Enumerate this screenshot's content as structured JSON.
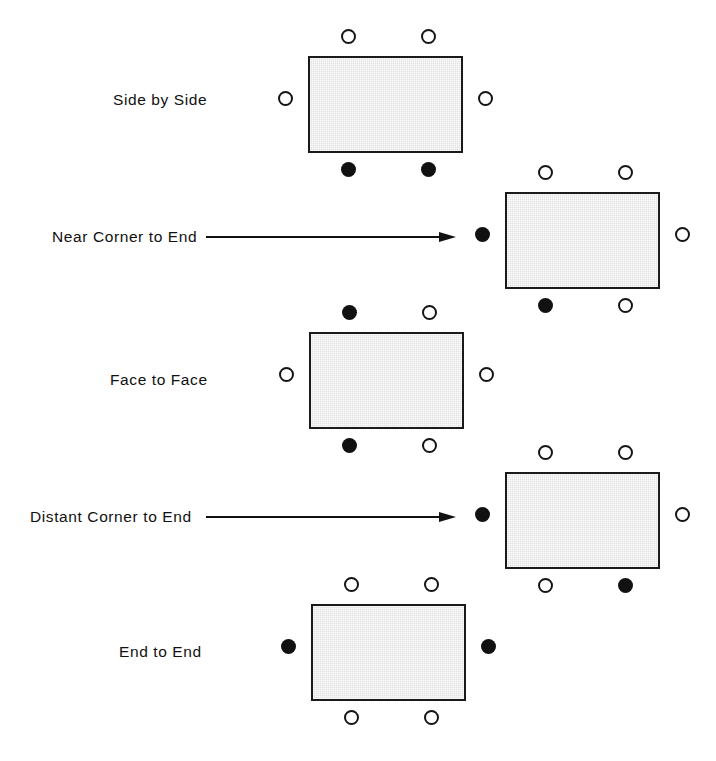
{
  "figure": {
    "background_color": "#ffffff",
    "table_fill_color": "#e2e2e2",
    "table_border_color": "#1a1a1a",
    "seat_open_color": "#ffffff",
    "seat_filled_color": "#111111",
    "width": 716,
    "height": 761
  },
  "legend_semantics": {
    "open_seat": "unoccupied seat position",
    "filled_seat": "occupied seat position"
  },
  "rows": [
    {
      "label": "Side by Side",
      "label_left": 113,
      "label_top": 92,
      "has_arrow": false,
      "table": {
        "left": 308,
        "top": 56,
        "width": 155,
        "height": 97
      },
      "seats": [
        {
          "name": "seat-top-left",
          "state": "open",
          "x": 341,
          "y": 29
        },
        {
          "name": "seat-top-right",
          "state": "open",
          "x": 421,
          "y": 29
        },
        {
          "name": "seat-left",
          "state": "open",
          "x": 278,
          "y": 91
        },
        {
          "name": "seat-right",
          "state": "open",
          "x": 478,
          "y": 91
        },
        {
          "name": "seat-bottom-left",
          "state": "filled",
          "x": 341,
          "y": 162
        },
        {
          "name": "seat-bottom-right",
          "state": "filled",
          "x": 421,
          "y": 162
        }
      ]
    },
    {
      "label": "Near Corner to End",
      "label_left": 52,
      "label_top": 229,
      "has_arrow": true,
      "arrow": {
        "left": 206,
        "top": 231,
        "length": 250
      },
      "table": {
        "left": 505,
        "top": 192,
        "width": 155,
        "height": 97
      },
      "seats": [
        {
          "name": "seat-top-left",
          "state": "open",
          "x": 538,
          "y": 165
        },
        {
          "name": "seat-top-right",
          "state": "open",
          "x": 618,
          "y": 165
        },
        {
          "name": "seat-left",
          "state": "filled",
          "x": 475,
          "y": 227
        },
        {
          "name": "seat-right",
          "state": "open",
          "x": 675,
          "y": 227
        },
        {
          "name": "seat-bottom-left",
          "state": "filled",
          "x": 538,
          "y": 298
        },
        {
          "name": "seat-bottom-right",
          "state": "open",
          "x": 618,
          "y": 298
        }
      ]
    },
    {
      "label": "Face to Face",
      "label_left": 110,
      "label_top": 372,
      "has_arrow": false,
      "table": {
        "left": 309,
        "top": 332,
        "width": 155,
        "height": 97
      },
      "seats": [
        {
          "name": "seat-top-left",
          "state": "filled",
          "x": 342,
          "y": 305
        },
        {
          "name": "seat-top-right",
          "state": "open",
          "x": 422,
          "y": 305
        },
        {
          "name": "seat-left",
          "state": "open",
          "x": 279,
          "y": 367
        },
        {
          "name": "seat-right",
          "state": "open",
          "x": 479,
          "y": 367
        },
        {
          "name": "seat-bottom-left",
          "state": "filled",
          "x": 342,
          "y": 438
        },
        {
          "name": "seat-bottom-right",
          "state": "open",
          "x": 422,
          "y": 438
        }
      ]
    },
    {
      "label": "Distant Corner to End",
      "label_left": 30,
      "label_top": 509,
      "has_arrow": true,
      "arrow": {
        "left": 206,
        "top": 511,
        "length": 250
      },
      "table": {
        "left": 505,
        "top": 472,
        "width": 155,
        "height": 97
      },
      "seats": [
        {
          "name": "seat-top-left",
          "state": "open",
          "x": 538,
          "y": 445
        },
        {
          "name": "seat-top-right",
          "state": "open",
          "x": 618,
          "y": 445
        },
        {
          "name": "seat-left",
          "state": "filled",
          "x": 475,
          "y": 507
        },
        {
          "name": "seat-right",
          "state": "open",
          "x": 675,
          "y": 507
        },
        {
          "name": "seat-bottom-left",
          "state": "open",
          "x": 538,
          "y": 578
        },
        {
          "name": "seat-bottom-right",
          "state": "filled",
          "x": 618,
          "y": 578
        }
      ]
    },
    {
      "label": "End to End",
      "label_left": 119,
      "label_top": 644,
      "has_arrow": false,
      "table": {
        "left": 311,
        "top": 604,
        "width": 155,
        "height": 97
      },
      "seats": [
        {
          "name": "seat-top-left",
          "state": "open",
          "x": 344,
          "y": 577
        },
        {
          "name": "seat-top-right",
          "state": "open",
          "x": 424,
          "y": 577
        },
        {
          "name": "seat-left",
          "state": "filled",
          "x": 281,
          "y": 639
        },
        {
          "name": "seat-right",
          "state": "filled",
          "x": 481,
          "y": 639
        },
        {
          "name": "seat-bottom-left",
          "state": "open",
          "x": 344,
          "y": 710
        },
        {
          "name": "seat-bottom-right",
          "state": "open",
          "x": 424,
          "y": 710
        }
      ]
    }
  ]
}
